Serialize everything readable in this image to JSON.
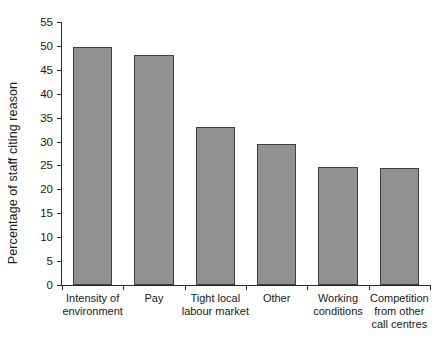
{
  "chart_data": {
    "type": "bar",
    "title": "",
    "xlabel": "",
    "ylabel": "Percentage of staff citing reason",
    "ylim": [
      0,
      55
    ],
    "ytick_step": 5,
    "grid": false,
    "legend": "none",
    "bar_color": "#919191",
    "bar_edge_color": "#3d3d3d",
    "axis_color": "#2b2b2b",
    "background": "#ffffff",
    "categories": [
      "Intensity of environment",
      "Pay",
      "Tight local labour market",
      "Other",
      "Working conditions",
      "Competition from other call centres"
    ],
    "category_lines": [
      [
        "Intensity of",
        "environment"
      ],
      [
        "Pay"
      ],
      [
        "Tight local",
        "labour market"
      ],
      [
        "Other"
      ],
      [
        "Working",
        "conditions"
      ],
      [
        "Competition",
        "from other",
        "call centres"
      ]
    ],
    "values": [
      49.8,
      48.1,
      33.0,
      29.5,
      24.7,
      24.4
    ],
    "ytick_labels": [
      "0",
      "5",
      "10",
      "15",
      "20",
      "25",
      "30",
      "35",
      "40",
      "45",
      "50",
      "55"
    ],
    "ytick_values": [
      0,
      5,
      10,
      15,
      20,
      25,
      30,
      35,
      40,
      45,
      50,
      55
    ]
  }
}
